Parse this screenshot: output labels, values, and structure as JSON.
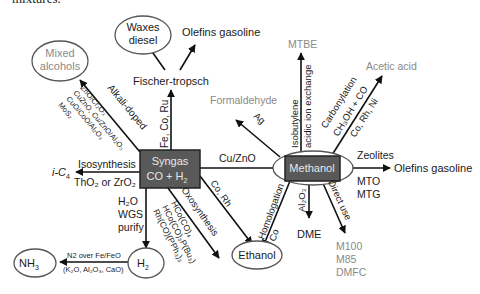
{
  "caption_fragment": "mixtures.",
  "nodes": {
    "syngas": {
      "line1": "Syngas",
      "line2": "CO + H",
      "sub": "2"
    },
    "methanol": {
      "label": "Methanol"
    },
    "waxes": {
      "line1": "Waxes",
      "line2": "diesel"
    },
    "olefins_top": {
      "label": "Olefins gasoline"
    },
    "fischer": {
      "label": "Fischer-tropsch"
    },
    "mixed_alcohols": {
      "line1": "Mixed",
      "line2": "alcohols"
    },
    "formaldehyde": {
      "label": "Formaldehyde"
    },
    "mtbe": {
      "label": "MTBE"
    },
    "acetic_acid": {
      "label": "Acetic acid"
    },
    "olefins_right": {
      "label": "Olefins gasoline"
    },
    "ic4": {
      "label": "i-C",
      "sub": "4"
    },
    "nh3": {
      "label": "NH",
      "sub": "3"
    },
    "h2": {
      "label": "H",
      "sub": "2"
    },
    "ethanol": {
      "label": "Ethanol"
    },
    "dme": {
      "label": "DME"
    },
    "direct_products": [
      "M100",
      "M85",
      "DMFC"
    ]
  },
  "edge_labels": {
    "fe_co_ru": "Fe, Co, Ru",
    "alkali_doped": "Alkali-doped",
    "alcohol_catalysts": [
      "ZnO/Cr₂O₃",
      "CuZnO, Cu/ZnO/Al₂O₃",
      "CuO/CoO/Al₂O₃",
      "MoS₂"
    ],
    "isosynthesis": "Isosynthesis",
    "tho2_zro2": "ThO₂ or ZrO₂",
    "h2o": "H₂O",
    "wgs": "WGS",
    "purify": "purify",
    "n2_over": "N2 over Fe/FeO",
    "promoters": "(K₂O, Al₂O₃, CaO)",
    "oxosynthesis": "Oxosynthesis",
    "oxo_catalysts": [
      "HCo(CO)₄",
      "HCo(CO)₃P(Bu₃)",
      "Rh(CO)(PPh₃)₃"
    ],
    "co_rh": "Co, Rh",
    "cu_zno": "Cu/ZnO",
    "ag": "Ag",
    "isobutylene": "Isobutylene",
    "acidic_ion": "acidic ion exchange",
    "carbonylation": "Carbonylation",
    "ch3oh_co": "CH₃OH + CO",
    "co_rh_ni": "Co, Rh, Ni",
    "zeolites": "Zeolites",
    "mto": "MTO",
    "mtg": "MTG",
    "homologation": "Homologation",
    "co": "Co",
    "al2o3": "Al₂O₃",
    "direct_use": "Direct use"
  },
  "colors": {
    "node_fill": "#595959",
    "node_text": "#e6e6e6",
    "primary_text": "#1a1a1a",
    "secondary_text": "#8a8a8a",
    "oval_stroke": "#555555"
  }
}
